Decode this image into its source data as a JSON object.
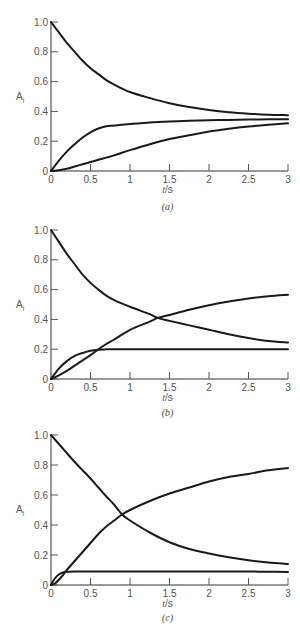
{
  "chart_data": [
    {
      "id": "a",
      "type": "line",
      "caption": "(a)",
      "xlabel_italic": "t",
      "xlabel_rest": "/s",
      "ylabel_main": "A",
      "ylabel_sub": "i",
      "xlim": [
        0,
        3
      ],
      "ylim": [
        0,
        1
      ],
      "xticks": [
        0,
        0.5,
        1,
        1.5,
        2,
        2.5,
        3
      ],
      "xtick_labels": [
        "0",
        "0.5",
        "1",
        "1.5",
        "2",
        "2.5",
        "3"
      ],
      "yticks": [
        0,
        0.2,
        0.4,
        0.6,
        0.8,
        1.0
      ],
      "ytick_labels": [
        "0",
        "0.2",
        "0.4",
        "0.6",
        "0.8",
        "1.0"
      ],
      "grid": false,
      "legend": null,
      "x": [
        0,
        0.1,
        0.2,
        0.3,
        0.4,
        0.5,
        0.6,
        0.7,
        0.8,
        1.0,
        1.25,
        1.5,
        1.75,
        2.0,
        2.25,
        2.5,
        2.75,
        3.0
      ],
      "series": [
        {
          "name": "A1 (decay)",
          "values": [
            1.0,
            0.93,
            0.86,
            0.8,
            0.74,
            0.69,
            0.65,
            0.61,
            0.58,
            0.53,
            0.49,
            0.455,
            0.43,
            0.41,
            0.395,
            0.385,
            0.378,
            0.375
          ]
        },
        {
          "name": "A2 (fast rise)",
          "values": [
            0.0,
            0.07,
            0.13,
            0.18,
            0.225,
            0.26,
            0.285,
            0.3,
            0.305,
            0.315,
            0.325,
            0.332,
            0.337,
            0.34,
            0.343,
            0.345,
            0.347,
            0.348
          ]
        },
        {
          "name": "A3 (slow rise)",
          "values": [
            0.0,
            0.005,
            0.015,
            0.03,
            0.045,
            0.06,
            0.075,
            0.09,
            0.105,
            0.14,
            0.18,
            0.215,
            0.24,
            0.265,
            0.283,
            0.298,
            0.31,
            0.32
          ]
        }
      ]
    },
    {
      "id": "b",
      "type": "line",
      "caption": "(b)",
      "xlabel_italic": "t",
      "xlabel_rest": "/s",
      "ylabel_main": "A",
      "ylabel_sub": "i",
      "xlim": [
        0,
        3
      ],
      "ylim": [
        0,
        1
      ],
      "xticks": [
        0,
        0.5,
        1,
        1.5,
        2,
        2.5,
        3
      ],
      "xtick_labels": [
        "0",
        "0.5",
        "1",
        "1.5",
        "2",
        "2.5",
        "3"
      ],
      "yticks": [
        0,
        0.2,
        0.4,
        0.6,
        0.8,
        1.0
      ],
      "ytick_labels": [
        "0",
        "0.2",
        "0.4",
        "0.6",
        "0.8",
        "1.0"
      ],
      "grid": false,
      "legend": null,
      "x": [
        0,
        0.1,
        0.2,
        0.3,
        0.4,
        0.5,
        0.6,
        0.7,
        0.8,
        1.0,
        1.25,
        1.35,
        1.5,
        1.75,
        2.0,
        2.25,
        2.5,
        2.75,
        3.0
      ],
      "series": [
        {
          "name": "A1 (decay)",
          "values": [
            1.0,
            0.92,
            0.84,
            0.77,
            0.7,
            0.645,
            0.6,
            0.56,
            0.53,
            0.485,
            0.435,
            0.41,
            0.39,
            0.36,
            0.33,
            0.3,
            0.275,
            0.255,
            0.245
          ]
        },
        {
          "name": "A2 (fast plateau)",
          "values": [
            0.0,
            0.07,
            0.12,
            0.155,
            0.175,
            0.19,
            0.197,
            0.199,
            0.2,
            0.2,
            0.2,
            0.2,
            0.2,
            0.2,
            0.2,
            0.2,
            0.2,
            0.2,
            0.2
          ]
        },
        {
          "name": "A3 (slow rise)",
          "values": [
            0.0,
            0.025,
            0.055,
            0.09,
            0.125,
            0.16,
            0.2,
            0.235,
            0.265,
            0.33,
            0.385,
            0.41,
            0.43,
            0.465,
            0.495,
            0.52,
            0.54,
            0.555,
            0.565
          ]
        }
      ]
    },
    {
      "id": "c",
      "type": "line",
      "caption": "(c)",
      "xlabel_italic": "t",
      "xlabel_rest": "/s",
      "ylabel_main": "A",
      "ylabel_sub": "i",
      "xlim": [
        0,
        3
      ],
      "ylim": [
        0,
        1
      ],
      "xticks": [
        0,
        0.5,
        1,
        1.5,
        2,
        2.5,
        3
      ],
      "xtick_labels": [
        "0",
        "0.5",
        "1",
        "1.5",
        "2",
        "2.5",
        "3"
      ],
      "yticks": [
        0,
        0.2,
        0.4,
        0.6,
        0.8,
        1.0
      ],
      "ytick_labels": [
        "0",
        "0.2",
        "0.4",
        "0.6",
        "0.8",
        "1.0"
      ],
      "grid": false,
      "legend": null,
      "x": [
        0,
        0.05,
        0.1,
        0.15,
        0.2,
        0.3,
        0.4,
        0.5,
        0.6,
        0.7,
        0.8,
        0.9,
        1.0,
        1.25,
        1.5,
        1.75,
        2.0,
        2.25,
        2.5,
        2.75,
        3.0
      ],
      "series": [
        {
          "name": "A1 (decay)",
          "values": [
            1.0,
            0.97,
            0.94,
            0.91,
            0.88,
            0.82,
            0.765,
            0.71,
            0.65,
            0.59,
            0.535,
            0.47,
            0.43,
            0.35,
            0.285,
            0.24,
            0.21,
            0.185,
            0.165,
            0.15,
            0.14
          ]
        },
        {
          "name": "A2 (fast plateau)",
          "values": [
            0.0,
            0.045,
            0.07,
            0.083,
            0.088,
            0.09,
            0.09,
            0.09,
            0.09,
            0.09,
            0.09,
            0.09,
            0.09,
            0.09,
            0.09,
            0.09,
            0.09,
            0.09,
            0.09,
            0.088,
            0.087
          ]
        },
        {
          "name": "A3 (rise)",
          "values": [
            0.0,
            0.01,
            0.035,
            0.065,
            0.1,
            0.16,
            0.22,
            0.28,
            0.34,
            0.39,
            0.43,
            0.47,
            0.5,
            0.56,
            0.61,
            0.65,
            0.69,
            0.72,
            0.74,
            0.765,
            0.78
          ]
        }
      ]
    }
  ],
  "layout": {
    "panels": [
      {
        "x0": 51,
        "x1": 288,
        "y0": 171,
        "y1": 22,
        "caption_y": 210,
        "ylabel_y": 100,
        "xlabel_y": 193
      },
      {
        "x0": 51,
        "x1": 288,
        "y0": 379,
        "y1": 230,
        "caption_y": 416,
        "ylabel_y": 308,
        "xlabel_y": 401
      },
      {
        "x0": 51,
        "x1": 288,
        "y0": 585,
        "y1": 435,
        "caption_y": 621,
        "ylabel_y": 513,
        "xlabel_y": 607
      }
    ]
  }
}
